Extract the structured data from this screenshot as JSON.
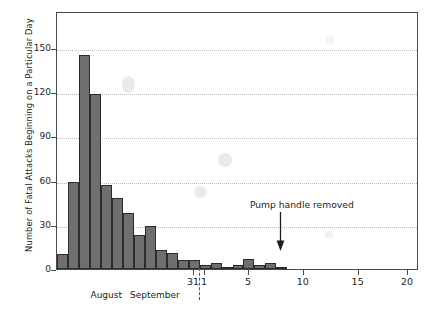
{
  "chart_data": {
    "type": "bar",
    "title": "",
    "subtitle": "",
    "xlabel": "",
    "ylabel": "Number of Fatal Attacks Beginning on a Particular Day",
    "ylim": [
      0,
      175
    ],
    "yticks": [
      0,
      30,
      60,
      90,
      120,
      150
    ],
    "ytick_labels": [
      "0",
      "30",
      "60",
      "90",
      "120",
      "150"
    ],
    "grid": true,
    "legend": "none",
    "x_axis_note": "Dates span 19 August to 30 September 1854; labelled ticks are 31 (August), 1, 5, 10, 15 and 20 (September)",
    "xticks": [
      31,
      1,
      5,
      10,
      15,
      20
    ],
    "xtick_labels": [
      "31",
      "1",
      "5",
      "10",
      "15",
      "20"
    ],
    "month_labels": [
      "August",
      "September"
    ],
    "categories": [
      "Aug 19",
      "Aug 20",
      "Aug 21",
      "Aug 22",
      "Aug 23",
      "Aug 24",
      "Aug 25",
      "Aug 26",
      "Aug 27",
      "Aug 28",
      "Aug 29",
      "Aug 30",
      "Aug 31",
      "Sep 1",
      "Sep 2",
      "Sep 3",
      "Sep 4",
      "Sep 5",
      "Sep 6",
      "Sep 7",
      "Sep 8",
      "Sep 9",
      "Sep 10",
      "Sep 11",
      "Sep 12",
      "Sep 13",
      "Sep 14",
      "Sep 15",
      "Sep 16",
      "Sep 17",
      "Sep 18",
      "Sep 19",
      "Sep 20"
    ],
    "values": [
      10,
      59,
      145,
      119,
      57,
      48,
      38,
      23,
      29,
      13,
      11,
      6,
      6,
      3,
      4,
      1,
      3,
      7,
      3,
      4,
      1,
      0,
      0,
      0,
      0,
      0,
      0,
      0,
      0,
      0,
      0,
      0,
      0
    ],
    "annotations": [
      {
        "text": "Pump handle removed",
        "x_position": "Sep 8",
        "arrow": "down-arrow"
      }
    ],
    "colors": {
      "bar_fill": "#6f6f6f",
      "bar_stroke": "#2b2b2b",
      "gridline": "#b9b9b9",
      "axis": "#4a4a4a",
      "text": "#1d1d1d",
      "background": "#ffffff"
    }
  }
}
